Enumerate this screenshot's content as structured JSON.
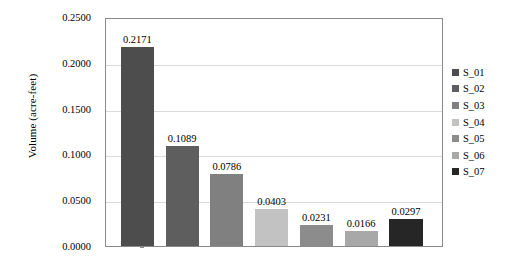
{
  "chart_data": {
    "type": "bar",
    "title": "",
    "xlabel": "",
    "ylabel": "Volume (acre-feet)",
    "categories": [
      "S_01",
      "S_02",
      "S_03",
      "S_04",
      "S_05",
      "S_06",
      "S_07"
    ],
    "values": [
      0.2171,
      0.1089,
      0.0786,
      0.0403,
      0.0231,
      0.0166,
      0.0297
    ],
    "value_labels": [
      "0.2171",
      "0.1089",
      "0.0786",
      "0.0403",
      "0.0231",
      "0.0166",
      "0.0297"
    ],
    "ylim": [
      0.0,
      0.25
    ],
    "ytick_values": [
      0.0,
      0.05,
      0.1,
      0.15,
      0.2,
      0.25
    ],
    "ytick_labels": [
      "0.0000",
      "0.0500",
      "0.1000",
      "0.1500",
      "0.2000",
      "0.2500"
    ],
    "xtick_labels": [],
    "grid": "horizontal",
    "legend_position": "right",
    "series_colors": [
      "#4d4d4d",
      "#5e5e5e",
      "#808080",
      "#c2c2c2",
      "#8c8c8c",
      "#a8a8a8",
      "#262626"
    ],
    "legend_entries": [
      {
        "label": "S_01",
        "color": "#4d4d4d"
      },
      {
        "label": "S_02",
        "color": "#5e5e5e"
      },
      {
        "label": "S_03",
        "color": "#808080"
      },
      {
        "label": "S_04",
        "color": "#c2c2c2"
      },
      {
        "label": "S_05",
        "color": "#8c8c8c"
      },
      {
        "label": "S_06",
        "color": "#a8a8a8"
      },
      {
        "label": "S_07",
        "color": "#262626"
      }
    ],
    "axis_color": "#8a8a8a",
    "gridline_color": "#d9d9d9",
    "background_color": "#ffffff"
  }
}
